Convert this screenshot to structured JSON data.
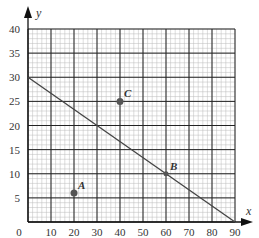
{
  "chart_data": {
    "type": "scatter",
    "title": "",
    "xlabel": "x",
    "ylabel": "y",
    "xlim": [
      0,
      90
    ],
    "ylim": [
      0,
      40
    ],
    "grid": true,
    "x_ticks": [
      "10",
      "20",
      "30",
      "40",
      "50",
      "60",
      "70",
      "80",
      "90"
    ],
    "y_ticks": [
      "5",
      "10",
      "15",
      "20",
      "25",
      "30",
      "35",
      "40"
    ],
    "origin_label": "0",
    "points": [
      {
        "label": "A",
        "x": 20,
        "y": 6
      },
      {
        "label": "B",
        "x": 60,
        "y": 10
      },
      {
        "label": "C",
        "x": 40,
        "y": 25
      }
    ],
    "line": {
      "x1": 0,
      "y1": 30,
      "x2": 90,
      "y2": 0,
      "equation": "y = 30 - x/3"
    }
  },
  "colors": {
    "major_grid": "#222222",
    "minor_grid": "#bbbbbb",
    "line": "#444444",
    "point": "#555555"
  }
}
